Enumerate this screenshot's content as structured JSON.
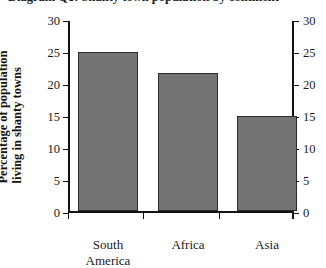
{
  "chart_data": {
    "type": "bar",
    "title": "Diagram Q1: Shanty town population by continent",
    "xlabel": "",
    "ylabel_line1": "Percentage of population",
    "ylabel_line2": "living in shanty towns",
    "categories": [
      "South America",
      "Africa",
      "Asia"
    ],
    "category_lines": [
      [
        "South",
        "America"
      ],
      [
        "Africa"
      ],
      [
        "Asia"
      ]
    ],
    "values": [
      25.1,
      21.8,
      15.1
    ],
    "ylim": [
      0,
      30
    ],
    "yticks": [
      0,
      5,
      10,
      15,
      20,
      25,
      30
    ],
    "ytick_labels_left": [
      "30",
      "25",
      "20",
      "15",
      "10",
      "5",
      "0"
    ],
    "ytick_labels_right": [
      "30",
      "25",
      "20",
      "15",
      "10",
      "5",
      "0"
    ],
    "grid": false,
    "legend": null,
    "bar_color": "#737373",
    "bar_edge_color": "#2b2b2b",
    "axis_color": "#121212",
    "dual_axis": true
  }
}
